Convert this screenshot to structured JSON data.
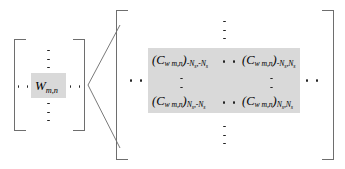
{
  "figure": {
    "type": "block-matrix-equation-diagram",
    "left_matrix": {
      "name": "weight-matrix",
      "entry": {
        "symbol": "W",
        "subscript": "m,n",
        "full_text": "W m,n"
      },
      "ellipses": [
        "horizontal-left",
        "horizontal-right",
        "vertical-up",
        "vertical-down"
      ]
    },
    "right_matrix": {
      "name": "covariance-block-matrix",
      "entries": [
        {
          "position": "top-left",
          "symbol": "(C",
          "symbol_sub": "w m,n",
          "close": ")",
          "index_row": "-N",
          "index_row_sub": "s",
          "index_col": "-N",
          "index_col_sub": "s",
          "full_text": "(C w m,n)-Ns,-Ns"
        },
        {
          "position": "top-right",
          "symbol": "(C",
          "symbol_sub": "w m,n",
          "close": ")",
          "index_row": "-N",
          "index_row_sub": "s",
          "index_col": "N",
          "index_col_sub": "s",
          "full_text": "(C w m,n)-Ns,Ns"
        },
        {
          "position": "bottom-left",
          "symbol": "(C",
          "symbol_sub": "w m,n",
          "close": ")",
          "index_row": "N",
          "index_row_sub": "s",
          "index_col": "-N",
          "index_col_sub": "s",
          "full_text": "(C w m,n)Ns,-Ns"
        },
        {
          "position": "bottom-right",
          "symbol": "(C",
          "symbol_sub": "w m,n",
          "close": ")",
          "index_row": "N",
          "index_row_sub": "s",
          "index_col": "N",
          "index_col_sub": "s",
          "full_text": "(C w m,n)Ns,Ns"
        }
      ],
      "ellipses": [
        "vertical-top-outer",
        "vertical-bottom-outer",
        "horizontal-left-outer",
        "horizontal-right-outer",
        "horizontal-top-inner",
        "horizontal-bottom-inner",
        "vertical-left-inner",
        "vertical-right-inner"
      ]
    },
    "connector": {
      "name": "expansion-fan",
      "description": "two straight lines fanning from the left matrix element to the right matrix brackets"
    },
    "colors": {
      "highlight": "#d9d9d9",
      "bracket": "#6e6e6e",
      "line": "#7a7a7a",
      "text": "#000000",
      "background": "#ffffff"
    }
  }
}
